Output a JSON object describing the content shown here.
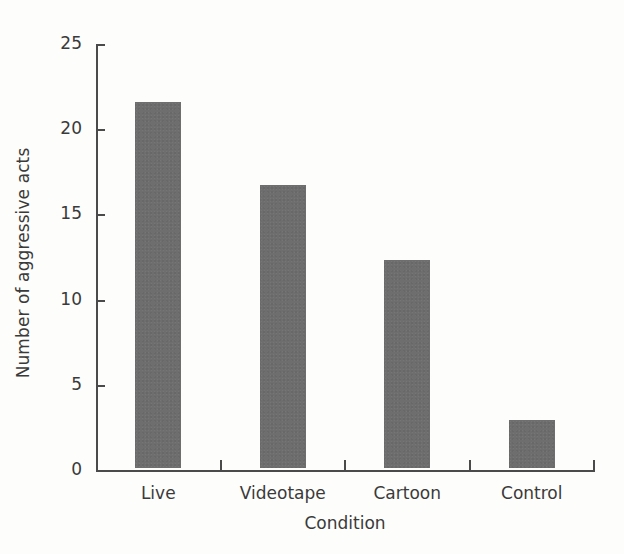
{
  "chart_data": {
    "type": "bar",
    "title": "",
    "xlabel": "Condition",
    "ylabel": "Number of aggressive acts",
    "categories": [
      "Live",
      "Videotape",
      "Cartoon",
      "Control"
    ],
    "values": [
      21.5,
      16.6,
      12.2,
      2.8
    ],
    "ylim": [
      0,
      25
    ],
    "yticks": [
      0,
      5,
      10,
      15,
      20,
      25
    ],
    "ytick_labels": [
      "0",
      "5",
      "10",
      "15",
      "20",
      "25"
    ],
    "grid": false,
    "legend": null,
    "bar_color": "#6e6e6e",
    "axis_color": "#4a4a4a",
    "background_color": "#fdfdfb",
    "text_color": "#3a3a3a"
  }
}
